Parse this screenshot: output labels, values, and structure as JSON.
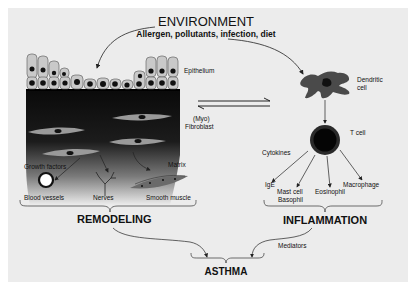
{
  "title": "ENVIRONMENT",
  "subtitle": "Allergen, pollutants, infection, diet",
  "colors": {
    "background": "#ececec",
    "page": "#ffffff",
    "cell_fill": "#c9c9c9",
    "nucleus": "#111111",
    "dendritic": "#4a4a4a",
    "text": "#111111"
  },
  "left": {
    "epithelium_label": "Epithelium",
    "fibroblast_label_line1": "(Myo)",
    "fibroblast_label_line2": "Fibroblast",
    "growth_factors_label": "Growth factors",
    "matrix_label": "Matrix",
    "targets": [
      "Blood vessels",
      "Nerves",
      "Smooth muscle"
    ],
    "group_label": "REMODELING"
  },
  "right": {
    "dendritic_label_line1": "Dendritic",
    "dendritic_label_line2": "cell",
    "tcell_label": "T cell",
    "cytokines_label": "Cytokines",
    "targets": [
      "IgE",
      "Mast cell",
      "Basophil",
      "Eosinophil",
      "Macrophage"
    ],
    "group_label": "INFLAMMATION"
  },
  "bottom": {
    "mediators_label": "Mediators",
    "outcome_label": "ASTHMA"
  },
  "icons": [
    "arrow-icon",
    "equilibrium-arrows-icon",
    "brace-icon",
    "blood-vessel-icon",
    "nerve-icon",
    "smooth-muscle-icon",
    "fibroblast-icon",
    "dendritic-cell-icon",
    "t-cell-icon",
    "epithelial-cell-icon"
  ]
}
